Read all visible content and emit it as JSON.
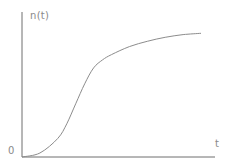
{
  "chart_data": {
    "type": "line",
    "title": "",
    "xlabel": "t",
    "ylabel": "n(t)",
    "origin_label": "0",
    "grid": false,
    "legend": null,
    "x": [
      0,
      0.1,
      0.2,
      0.25,
      0.3,
      0.35,
      0.4,
      0.45,
      0.5,
      0.6,
      0.7,
      0.8,
      0.9,
      1.0
    ],
    "series": [
      {
        "name": "n(t)",
        "values": [
          0,
          0.03,
          0.14,
          0.25,
          0.4,
          0.55,
          0.67,
          0.73,
          0.77,
          0.83,
          0.87,
          0.9,
          0.92,
          0.93
        ]
      }
    ],
    "xlim": [
      0,
      1
    ],
    "ylim": [
      0,
      1
    ],
    "colors": {
      "axis": "#6e6e6e",
      "curve": "#8c8c8c",
      "text": "#8a8a8a"
    }
  }
}
